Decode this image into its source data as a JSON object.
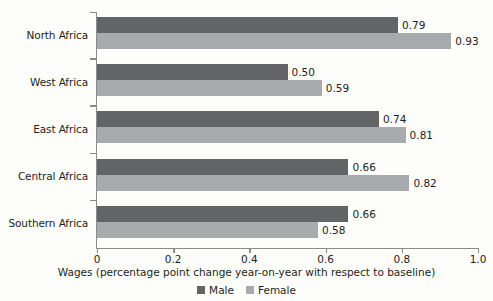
{
  "chart_data": {
    "type": "bar",
    "orientation": "horizontal",
    "title": "",
    "xlabel": "Wages (percentage point change year-on-year with respect to baseline)",
    "ylabel": "",
    "xlim": [
      0,
      1.0
    ],
    "xticks": [
      "0",
      "0.2",
      "0.4",
      "0.6",
      "0.8",
      "1.0"
    ],
    "xtick_values": [
      0,
      0.2,
      0.4,
      0.6,
      0.8,
      1.0
    ],
    "grid": false,
    "legend_position": "bottom",
    "categories": [
      "North Africa",
      "West Africa",
      "East Africa",
      "Central Africa",
      "Southern Africa"
    ],
    "series": [
      {
        "name": "Male",
        "color": "#636466",
        "values": [
          0.79,
          0.5,
          0.74,
          0.66,
          0.66
        ],
        "labels": [
          "0.79",
          "0.50",
          "0.74",
          "0.66",
          "0.66"
        ]
      },
      {
        "name": "Female",
        "color": "#a8aaad",
        "values": [
          0.93,
          0.59,
          0.81,
          0.82,
          0.58
        ],
        "labels": [
          "0.93",
          "0.59",
          "0.81",
          "0.82",
          "0.58"
        ]
      }
    ]
  },
  "legend": {
    "items": [
      {
        "label": "Male",
        "color": "#636466"
      },
      {
        "label": "Female",
        "color": "#a8aaad"
      }
    ]
  },
  "axis": {
    "x_title": "Wages (percentage point change year-on-year with respect to baseline)"
  }
}
